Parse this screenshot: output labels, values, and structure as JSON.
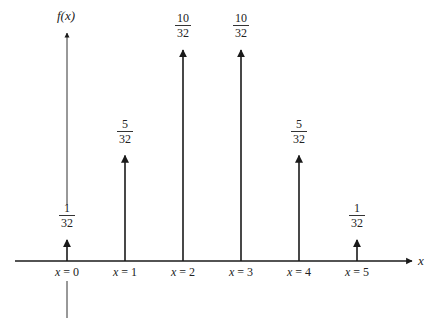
{
  "chart_data": {
    "type": "stem",
    "title": "",
    "xlabel": "x",
    "ylabel": "f(x)",
    "categories": [
      "x = 0",
      "x = 1",
      "x = 2",
      "x = 3",
      "x = 4",
      "x = 5"
    ],
    "x": [
      0,
      1,
      2,
      3,
      4,
      5
    ],
    "values": [
      0.03125,
      0.15625,
      0.3125,
      0.3125,
      0.15625,
      0.03125
    ],
    "value_labels": [
      {
        "num": "1",
        "den": "32"
      },
      {
        "num": "5",
        "den": "32"
      },
      {
        "num": "10",
        "den": "32"
      },
      {
        "num": "10",
        "den": "32"
      },
      {
        "num": "5",
        "den": "32"
      },
      {
        "num": "1",
        "den": "32"
      }
    ],
    "ylim": [
      0,
      0.3125
    ],
    "grid": false,
    "legend": null
  },
  "axes": {
    "y_label": "f(x)",
    "x_label": "x"
  },
  "colors": {
    "ink": "#1a1a1a",
    "background": "#ffffff"
  }
}
